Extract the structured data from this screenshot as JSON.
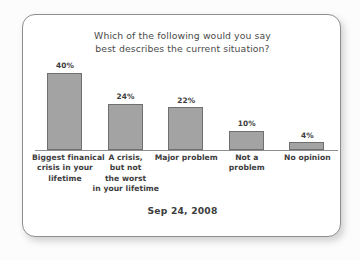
{
  "card": {
    "background": "#ffffff",
    "border_color": "#8e8e8e"
  },
  "chart_data": {
    "type": "bar",
    "title": "Which of the following would you say best describes the current situation?",
    "title_lines": [
      "Which of the following would you say",
      "best describes the current situation?"
    ],
    "caption": "Sep 24, 2008",
    "categories": [
      "Biggest finanical crisis in your lifetime",
      "A crisis, but not the worst in your lifetime",
      "Major problem",
      "Not a problem",
      "No opinion"
    ],
    "category_lines": [
      [
        "Biggest finanical",
        "crisis in your",
        "lifetime"
      ],
      [
        "A crisis,",
        "but not",
        "the worst",
        "in your lifetime"
      ],
      [
        "Major problem"
      ],
      [
        "Not a",
        "problem"
      ],
      [
        "No opinion"
      ]
    ],
    "values": [
      40,
      24,
      22,
      10,
      4
    ],
    "value_labels": [
      "40%",
      "24%",
      "22%",
      "10%",
      "4%"
    ],
    "xlabel": "",
    "ylabel": "",
    "ylim": [
      0,
      46
    ],
    "grid": false,
    "legend": "none",
    "bar_color": "#a3a3a3",
    "bar_border_color": "#6f6f6f",
    "axis_color": "#8d8d8d"
  }
}
